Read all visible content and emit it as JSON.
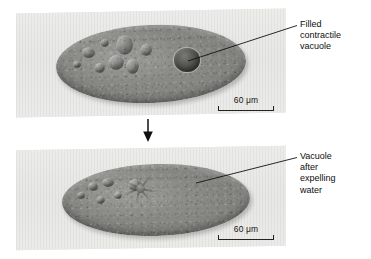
{
  "figure": {
    "panels": [
      {
        "id": "panel-top",
        "state": "filled",
        "scale_bar": {
          "value": "60",
          "unit": "μm",
          "text": "60 μm"
        },
        "callout": {
          "lines": [
            "Filled",
            "contractile",
            "vacuole"
          ]
        }
      },
      {
        "id": "panel-bottom",
        "state": "emptied",
        "scale_bar": {
          "value": "60",
          "unit": "μm",
          "text": "60 μm"
        },
        "callout": {
          "lines": [
            "Vacuole",
            "after",
            "expelling",
            "water"
          ]
        }
      }
    ],
    "flow_arrow": {
      "direction": "down",
      "icon": "arrow-down-icon"
    },
    "colors": {
      "background": "#ffffff",
      "panel_background": "#e8e8e6",
      "cell_body": "#7c7c79",
      "ink": "#0d0d0d",
      "rule": "#23231c"
    }
  }
}
